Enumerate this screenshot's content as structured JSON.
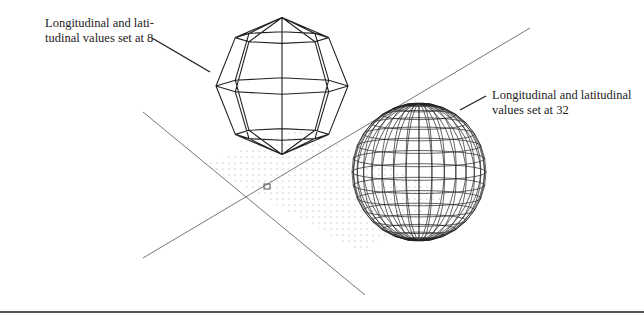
{
  "figure": {
    "annotations": [
      {
        "id": "left",
        "text": "Longitudinal and lati-\ntudinal values set at 8",
        "target": "coarse-sphere"
      },
      {
        "id": "right",
        "text": "Longitudinal and latitudinal\nvalues set at 32",
        "target": "fine-sphere"
      }
    ],
    "spheres": [
      {
        "name": "coarse-sphere",
        "segments": 8,
        "cx": 282,
        "cy": 86,
        "rx": 66,
        "ry": 69
      },
      {
        "name": "fine-sphere",
        "segments": 32,
        "cx": 419,
        "cy": 172,
        "rx": 67,
        "ry": 69
      }
    ],
    "axes": {
      "origin": [
        267,
        186
      ],
      "axis_a": [
        [
          143,
          112
        ],
        [
          365,
          295
        ]
      ],
      "axis_b": [
        [
          143,
          258
        ],
        [
          530,
          28
        ]
      ]
    },
    "grid": {
      "style": "dotted",
      "corners": [
        [
          300,
          127
        ],
        [
          450,
          195
        ],
        [
          360,
          252
        ],
        [
          205,
          165
        ]
      ]
    },
    "colors": {
      "line": "#333333",
      "axis": "#777777",
      "grid_dot": "#aaaaaa",
      "background": "#ffffff"
    }
  }
}
